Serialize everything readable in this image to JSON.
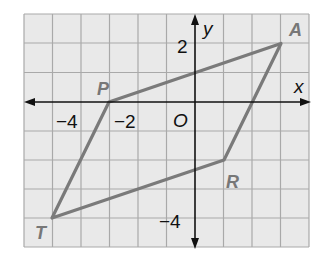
{
  "figure": {
    "type": "coordinate-plane-parallelogram",
    "grid": {
      "x_min": -6,
      "x_max": 4,
      "y_min": -5,
      "y_max": 3,
      "cell_fill": "#e9e9e9",
      "line_color": "#a9a9a9"
    },
    "axes": {
      "x_label": "x",
      "y_label": "y",
      "origin_label": "O",
      "color": "#111111"
    },
    "tick_labels": {
      "x": [
        {
          "value": -4,
          "text": "−4"
        },
        {
          "value": -2,
          "text": "−2"
        }
      ],
      "y": [
        {
          "value": 2,
          "text": "2"
        },
        {
          "value": -4,
          "text": "−4"
        }
      ]
    },
    "polygon": {
      "stroke": "#7a7a7a",
      "vertices": [
        {
          "name": "A",
          "x": 3,
          "y": 2
        },
        {
          "name": "R",
          "x": 1,
          "y": -2
        },
        {
          "name": "T",
          "x": -5,
          "y": -4
        },
        {
          "name": "P",
          "x": -3,
          "y": 0
        }
      ]
    }
  }
}
